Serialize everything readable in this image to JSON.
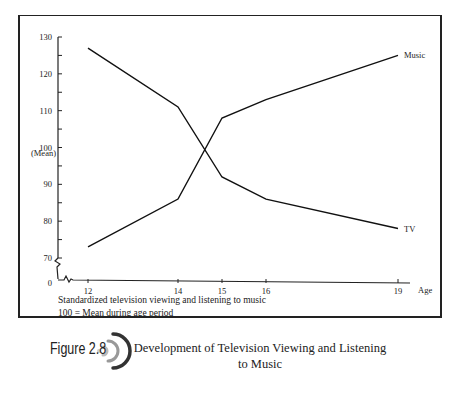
{
  "figure": {
    "label": "Figure 2.8",
    "title": "Development of Television Viewing and Listening to Music",
    "note_line1": "Standardized television viewing and listening to music",
    "note_line2": "100 = Mean during age period",
    "icon": "sound-waves-icon"
  },
  "chart_data": {
    "type": "line",
    "title": "Development of Television Viewing and Listening to Music",
    "xlabel": "Age",
    "ylabel": "(Mean)",
    "x": [
      12,
      14,
      15,
      16,
      19
    ],
    "y_ticks": [
      0,
      70,
      80,
      90,
      100,
      110,
      120,
      130
    ],
    "ylim": [
      70,
      130
    ],
    "axis_break": true,
    "series": [
      {
        "name": "TV",
        "values": [
          127,
          111,
          92,
          86,
          78
        ]
      },
      {
        "name": "Music",
        "values": [
          73,
          86,
          108,
          113,
          125
        ]
      }
    ],
    "grid": false,
    "legend": "inline labels at line ends"
  }
}
